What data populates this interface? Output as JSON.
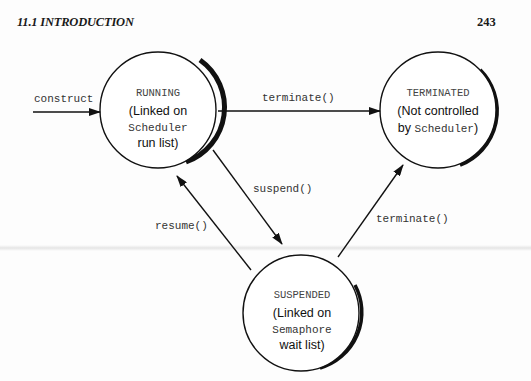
{
  "page": {
    "section_header": "11.1 INTRODUCTION",
    "page_number": "243"
  },
  "diagram": {
    "states": {
      "running": {
        "name": "RUNNING",
        "line1": "(Linked on",
        "line2_mono": "Scheduler",
        "line3": "run list)"
      },
      "terminated": {
        "name": "TERMINATED",
        "line1": "(Not controlled",
        "line2_prefix": "by ",
        "line2_mono": "Scheduler",
        "line2_suffix": ")"
      },
      "suspended": {
        "name": "SUSPENDED",
        "line1": "(Linked on",
        "line2_mono": "Semaphore",
        "line3": "wait list)"
      }
    },
    "transitions": {
      "construct": "construct",
      "running_to_terminated": "terminate()",
      "running_to_suspended": "suspend()",
      "suspended_to_running": "resume()",
      "suspended_to_terminated": "terminate()"
    }
  }
}
